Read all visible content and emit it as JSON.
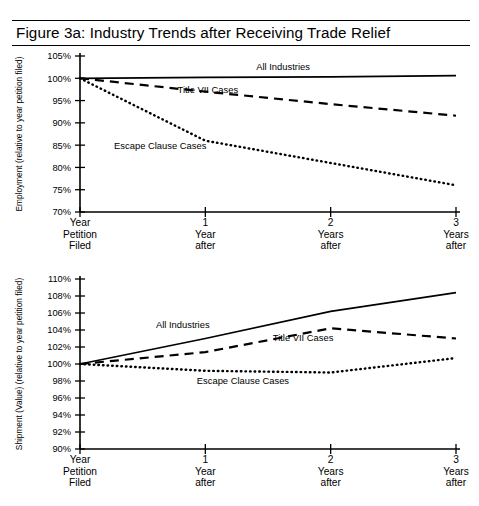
{
  "figure": {
    "title": "Figure 3a:  Industry Trends after Receiving Trade Relief"
  },
  "chart_data": [
    {
      "id": "employment",
      "type": "line",
      "title": "Figure 3a:  Industry Trends after Receiving Trade Relief",
      "xlabel": "",
      "ylabel": "Employment (relative to year petition filed)",
      "categories": [
        "Year Petition Filed",
        "1 Year after",
        "2 Years after",
        "3 Years after"
      ],
      "x": [
        0,
        1,
        2,
        3
      ],
      "ylim": [
        70,
        105
      ],
      "yticks": [
        70,
        75,
        80,
        85,
        90,
        95,
        100,
        105
      ],
      "ytick_labels": [
        "70%",
        "75%",
        "80%",
        "85%",
        "90%",
        "95%",
        "100%",
        "105%"
      ],
      "grid": false,
      "legend": "inline-annotations",
      "series": [
        {
          "name": "All Industries",
          "style": "solid",
          "values": [
            100.0,
            100.2,
            100.3,
            100.6
          ]
        },
        {
          "name": "Title VII Cases",
          "style": "dashed",
          "values": [
            100.0,
            97.0,
            94.2,
            91.6
          ]
        },
        {
          "name": "Escape Clause Cases",
          "style": "dotted",
          "values": [
            100.0,
            86.0,
            81.0,
            76.0
          ]
        }
      ],
      "annotations": [
        {
          "text": "All Industries",
          "x": 1.62,
          "y": 101.9
        },
        {
          "text": "Title VII Cases",
          "x": 1.02,
          "y": 96.6
        },
        {
          "text": "Escape Clause Cases",
          "x": 0.64,
          "y": 84.1
        }
      ]
    },
    {
      "id": "shipment",
      "type": "line",
      "title": "",
      "xlabel": "",
      "ylabel": "Shipment (Value) (relative to year petition filed)",
      "categories": [
        "Year Petition Filed",
        "1 Year after",
        "2 Years after",
        "3 Years after"
      ],
      "x": [
        0,
        1,
        2,
        3
      ],
      "ylim": [
        90,
        110
      ],
      "yticks": [
        90,
        92,
        94,
        96,
        98,
        100,
        102,
        104,
        106,
        108,
        110
      ],
      "ytick_labels": [
        "90%",
        "92%",
        "94%",
        "96%",
        "98%",
        "100%",
        "102%",
        "104%",
        "106%",
        "108%",
        "110%"
      ],
      "grid": false,
      "legend": "inline-annotations",
      "series": [
        {
          "name": "All Industries",
          "style": "solid",
          "values": [
            100.0,
            103.0,
            106.2,
            108.4
          ]
        },
        {
          "name": "Title VII Cases",
          "style": "dashed",
          "values": [
            100.0,
            101.4,
            104.2,
            103.0
          ]
        },
        {
          "name": "Escape Clause Cases",
          "style": "dotted",
          "values": [
            100.0,
            99.2,
            99.0,
            100.7
          ]
        }
      ],
      "annotations": [
        {
          "text": "All Industries",
          "x": 0.82,
          "y": 104.2
        },
        {
          "text": "Title VII Cases",
          "x": 1.78,
          "y": 102.7
        },
        {
          "text": "Escape Clause Cases",
          "x": 1.3,
          "y": 97.6
        }
      ]
    }
  ],
  "colors": {
    "ink": "#000000",
    "background": "#ffffff"
  }
}
